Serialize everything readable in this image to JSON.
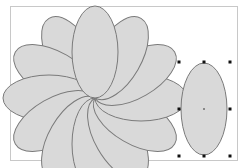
{
  "canvas": {
    "border_color": "#c8c8c8",
    "background": "#ffffff"
  },
  "shape_style": {
    "fill": "#d9d9d9",
    "stroke": "#7a7a7a"
  },
  "flower": {
    "center": [
      95,
      98
    ],
    "petal_rx": 23,
    "petal_ry": 46,
    "petal_count": 12,
    "angles": [
      330,
      300,
      270,
      240,
      210,
      180,
      150,
      120,
      90,
      60,
      30,
      0
    ]
  },
  "selected_ellipse": {
    "cx": 204,
    "cy": 109,
    "rx": 23,
    "ry": 46,
    "handles": [
      [
        179,
        62
      ],
      [
        204,
        62
      ],
      [
        230,
        62
      ],
      [
        179,
        109
      ],
      [
        230,
        109
      ],
      [
        179,
        156
      ],
      [
        204,
        156
      ],
      [
        230,
        156
      ]
    ],
    "center_marker": [
      204,
      109
    ]
  }
}
